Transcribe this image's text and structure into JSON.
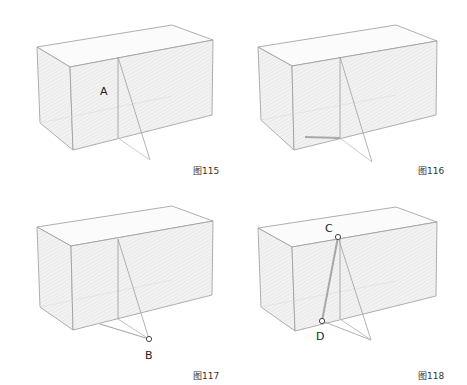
{
  "figures": [
    {
      "caption": "图115",
      "labels": [
        {
          "text": "A"
        }
      ]
    },
    {
      "caption": "图116",
      "labels": []
    },
    {
      "caption": "图117",
      "labels": [
        {
          "text": "B"
        }
      ]
    },
    {
      "caption": "图118",
      "labels": [
        {
          "text": "C"
        },
        {
          "text": "D"
        }
      ]
    }
  ],
  "colors": {
    "edge": "#9a9a9a",
    "face": "#ececec",
    "thick": "#a8a8a8",
    "text": "#222222"
  }
}
